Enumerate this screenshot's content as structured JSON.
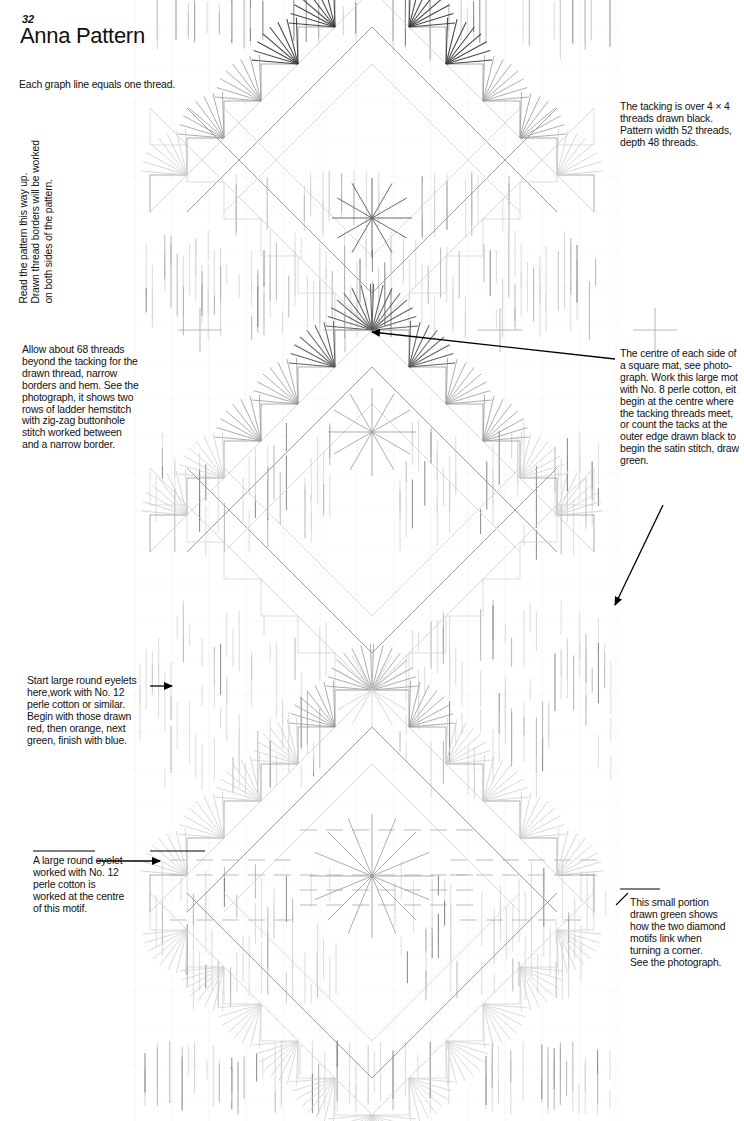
{
  "page": {
    "number": "32",
    "title": "Anna Pattern",
    "background": "#ffffff"
  },
  "notes": {
    "thread_scale": "Each graph line equals one thread.",
    "read_up": "Read the pattern this way up.\nDrawn thread borders will be worked\non both sides of the pattern.",
    "tacking": "The tacking is over 4 × 4\nthreads drawn black.\nPattern width 52 threads,\ndepth 48 threads.",
    "allow_threads": "Allow about 68 threads\nbeyond the tacking for the\ndrawn thread, narrow\nborders and hem. See the\nphotograph, it shows two\nrows of ladder hemstitch\nwith zig-zag buttonhole\nstitch worked between\nand a narrow border.",
    "centre_of_side": "The centre of each side of\na square mat, see photo-\ngraph. Work this large mot\nwith No. 8 perle cotton, eit\nbegin at the centre where\nthe tacking threads meet,\nor count the tacks at the\nouter edge drawn black to\nbegin the satin stitch, draw\ngreen.",
    "start_eyelets": "Start large round eyelets\nhere,work with No. 12\nperle cotton or similar.\nBegin with those drawn\nred, then orange, next\ngreen, finish with blue.",
    "large_eyelet": "A large round eyelet\nworked with No. 12\nperle cotton is\nworked at the centre\nof this motif.",
    "green_portion": "This small portion\ndrawn green shows\nhow the two diamond\nmotifs link when\nturning a corner.\nSee  the photograph."
  },
  "chart_data": {
    "type": "diagram",
    "title": "Anna Pattern",
    "subtitle": "Drawn-thread / hardanger embroidery working chart",
    "grid": {
      "cell": 37,
      "x_origin": 135,
      "y_origin": -8,
      "columns": 16,
      "rows": 31,
      "note": "Each graph line equals one thread."
    },
    "colors": {
      "grid_line": "#d9d9d9",
      "motif_light": "#cfcfcf",
      "motif_mid": "#9a9a9a",
      "motif_dark": "#5a5a5a",
      "fan_dark": "#3c3c3c",
      "dash_light": "#d4d4d4",
      "dash_mid": "#a8a8a8",
      "dash_dark": "#6e6e6e",
      "arrow": "#000000",
      "text": "#111111"
    },
    "elements": {
      "diamond_motifs": 3,
      "fan_eyelets": 40,
      "centre_star_radials": 16,
      "arrows": 4
    },
    "legend": [
      {
        "label": "tacking",
        "value": "4 × 4 threads drawn black"
      },
      {
        "label": "pattern width",
        "value": "52 threads"
      },
      {
        "label": "pattern depth",
        "value": "48 threads"
      },
      {
        "label": "margin allowance",
        "value": "68 threads"
      },
      {
        "label": "large motif thread",
        "value": "No. 8 perle cotton"
      },
      {
        "label": "eyelet thread",
        "value": "No. 12 perle cotton"
      },
      {
        "label": "eyelet order",
        "value": "red, orange, green, blue"
      }
    ]
  }
}
